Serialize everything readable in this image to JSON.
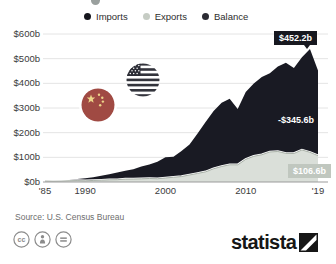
{
  "legend": [
    {
      "label": "Imports",
      "color": "#15161d"
    },
    {
      "label": "Exports",
      "color": "#c6ccc4"
    },
    {
      "label": "Balance",
      "color": "#2b2b33"
    }
  ],
  "chart_data": {
    "type": "area",
    "title": "",
    "x": [
      1985,
      1986,
      1987,
      1988,
      1989,
      1990,
      1991,
      1992,
      1993,
      1994,
      1995,
      1996,
      1997,
      1998,
      1999,
      2000,
      2001,
      2002,
      2003,
      2004,
      2005,
      2006,
      2007,
      2008,
      2009,
      2010,
      2011,
      2012,
      2013,
      2014,
      2015,
      2016,
      2017,
      2018,
      2019
    ],
    "series": [
      {
        "name": "Imports",
        "color": "#191a23",
        "values": [
          3.9,
          4.8,
          6.3,
          8.5,
          12.0,
          15.2,
          19.0,
          25.7,
          31.5,
          38.8,
          45.6,
          51.5,
          62.6,
          71.2,
          81.8,
          100.0,
          102.3,
          125.2,
          152.4,
          196.7,
          243.5,
          287.8,
          321.4,
          337.8,
          296.4,
          365.0,
          399.4,
          425.6,
          440.4,
          468.5,
          483.2,
          462.6,
          505.5,
          539.5,
          452.2
        ]
      },
      {
        "name": "Exports",
        "color": "#dadfd9",
        "values": [
          3.9,
          3.1,
          3.5,
          5.0,
          5.8,
          4.8,
          6.3,
          7.4,
          8.8,
          9.3,
          11.7,
          12.0,
          12.8,
          14.2,
          13.1,
          16.2,
          19.2,
          22.1,
          28.4,
          34.7,
          41.2,
          53.7,
          62.9,
          69.7,
          69.5,
          91.9,
          104.1,
          110.5,
          121.7,
          123.7,
          115.9,
          115.5,
          129.9,
          120.3,
          106.6
        ]
      },
      {
        "name": "Balance",
        "color": "#2b2b33",
        "values": [
          0.0,
          -1.7,
          -2.8,
          -3.5,
          -6.2,
          -10.4,
          -12.7,
          -18.3,
          -22.7,
          -29.5,
          -33.9,
          -39.5,
          -49.8,
          -57.0,
          -68.7,
          -83.8,
          -83.1,
          -103.1,
          -124.0,
          -162.0,
          -202.3,
          -234.1,
          -258.5,
          -268.1,
          -226.9,
          -273.1,
          -295.3,
          -315.1,
          -318.7,
          -344.8,
          -367.3,
          -347.1,
          -375.6,
          -419.2,
          -345.6
        ]
      }
    ],
    "ylim": [
      0,
      600
    ],
    "yticks": [
      "$0b",
      "$100b",
      "$200b",
      "$300b",
      "$400b",
      "$500b",
      "$600b"
    ],
    "xticks": [
      {
        "year": 1985,
        "label": "'85"
      },
      {
        "year": 1990,
        "label": "1990"
      },
      {
        "year": 2000,
        "label": "2000"
      },
      {
        "year": 2010,
        "label": "2010"
      },
      {
        "year": 2019,
        "label": "'19"
      }
    ],
    "grid": true,
    "legend_position": "top",
    "annotations": {
      "imports_end": "$452.2b",
      "balance_end": "-$345.6b",
      "exports_end": "$106.6b"
    }
  },
  "source": "Source: U.S. Census Bureau",
  "license_icons": [
    "cc-icon",
    "attribution-person-icon",
    "no-derivatives-equals-icon"
  ],
  "branding": {
    "logo_text": "statista"
  }
}
